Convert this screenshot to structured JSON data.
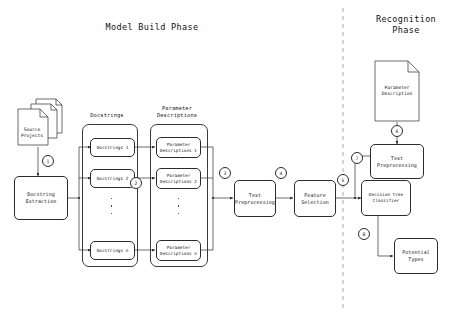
{
  "diagram": {
    "title_left": "Model Build Phase",
    "title_right": "Recognition\nPhase",
    "divider": "dashed-vertical-divider",
    "stroke_color": "#2b2b2b",
    "background_color": "#ffffff"
  },
  "model_build": {
    "source_projects": "Source\nProjects",
    "docstring_extraction": "Docstring\nExtraction",
    "docstrings_group_label": "Docstrings",
    "parameter_descriptions_group_label": "Parameter\nDescriptions",
    "docstrings": [
      "Docstrings 1",
      "Docstrings 2",
      "Docstrings n"
    ],
    "parameter_descriptions": [
      "Parameter\nDescriptions 1",
      "Parameter\nDescriptions 2",
      "Parameter\nDescriptions n"
    ],
    "text_preprocessing": "Text\nPreprocessing",
    "feature_selection": "Feature\nSelection"
  },
  "recognition": {
    "parameter_description_doc": "Parameter\nDescription",
    "text_preprocessing": "Text\nPreprocessing",
    "decision_tree_classifier": "Decision Tree\nClassifier",
    "potential_types": "Potential\nTypes"
  },
  "steps": {
    "s1": "1",
    "s2": "2",
    "s3": "3",
    "s4": "4",
    "s5": "5",
    "s6": "6",
    "s7": "7",
    "s8": "8"
  }
}
